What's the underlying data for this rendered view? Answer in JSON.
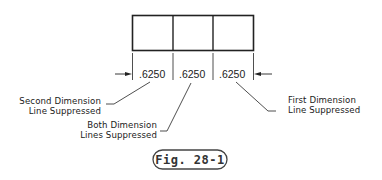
{
  "figure": {
    "caption": "Fig. 28-1"
  },
  "dimensions": [
    {
      "value": ".6250"
    },
    {
      "value": ".6250"
    },
    {
      "value": ".6250"
    }
  ],
  "callouts": {
    "second": {
      "line1": "Second Dimension",
      "line2": "Line Suppressed"
    },
    "both": {
      "line1": "Both Dimension",
      "line2": "Lines Suppressed"
    },
    "first": {
      "line1": "First Dimension",
      "line2": "Line Suppressed"
    }
  }
}
